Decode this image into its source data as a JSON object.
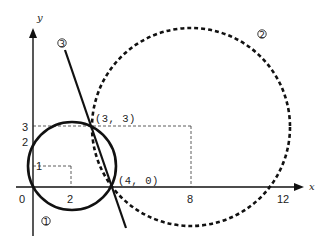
{
  "diagram": {
    "type": "coordinate-geometry",
    "axes": {
      "x_label": "x",
      "y_label": "y",
      "origin_label": "0",
      "x_ticks": [
        "2",
        "8",
        "12"
      ],
      "y_ticks": [
        "1",
        "2",
        "3"
      ]
    },
    "points": [
      {
        "label": "(3, 3)",
        "x": 3,
        "y": 3
      },
      {
        "label": "(4, 0)",
        "x": 4,
        "y": 0
      }
    ],
    "curves": [
      {
        "id": "1",
        "marker": "①",
        "kind": "circle",
        "style": "solid",
        "center": [
          2,
          1
        ],
        "radius": 2.236
      },
      {
        "id": "2",
        "marker": "②",
        "kind": "circle",
        "style": "dashed",
        "center": [
          8,
          3
        ],
        "radius": 5
      },
      {
        "id": "3",
        "marker": "③",
        "kind": "line",
        "style": "solid",
        "equation": "y = -3x + 12"
      }
    ],
    "guides": [
      {
        "from": [
          0,
          1
        ],
        "to": [
          2,
          1
        ]
      },
      {
        "from": [
          2,
          1
        ],
        "to": [
          2,
          0
        ]
      },
      {
        "from": [
          0,
          3
        ],
        "to": [
          8,
          3
        ]
      },
      {
        "from": [
          8,
          3
        ],
        "to": [
          8,
          0
        ]
      }
    ],
    "colors": {
      "ink": "#111111",
      "background": "#ffffff"
    }
  }
}
